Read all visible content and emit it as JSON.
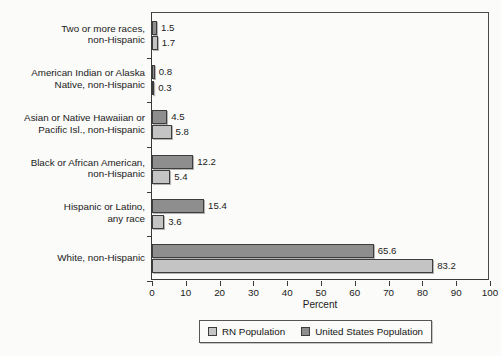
{
  "chart_data": {
    "type": "bar",
    "orientation": "horizontal",
    "grouped": true,
    "title": "",
    "xlabel": "Percent",
    "ylabel": "",
    "xlim": [
      0,
      100
    ],
    "xticks": [
      0,
      10,
      20,
      30,
      40,
      50,
      60,
      70,
      80,
      90,
      100
    ],
    "grid": false,
    "legend_position": "bottom",
    "categories": [
      "Two or more races, non-Hispanic",
      "American Indian or Alaska Native, non-Hispanic",
      "Asian or Native Hawaiian or Pacific Isl., non-Hispanic",
      "Black or African American, non-Hispanic",
      "Hispanic or Latino, any race",
      "White, non-Hispanic"
    ],
    "category_label_lines": [
      [
        "Two or more races,",
        "non-Hispanic"
      ],
      [
        "American Indian or Alaska",
        "Native, non-Hispanic"
      ],
      [
        "Asian or Native Hawaiian or",
        "Pacific Isl., non-Hispanic"
      ],
      [
        "Black or African American,",
        "non-Hispanic"
      ],
      [
        "Hispanic or Latino,",
        "any race"
      ],
      [
        "White, non-Hispanic"
      ]
    ],
    "series": [
      {
        "name": "United States Population",
        "color": "#8e8e8e",
        "values": [
          1.5,
          0.8,
          4.5,
          12.2,
          15.4,
          65.6
        ],
        "value_labels": [
          "1.5",
          "0.8",
          "4.5",
          "12.2",
          "15.4",
          "65.6"
        ]
      },
      {
        "name": "RN Population",
        "color": "#c4c4c4",
        "values": [
          1.7,
          0.3,
          5.8,
          5.4,
          3.6,
          83.2
        ],
        "value_labels": [
          "1.7",
          "0.3",
          "5.8",
          "5.4",
          "3.6",
          "83.2"
        ]
      }
    ]
  },
  "legend": {
    "items": [
      {
        "label": "RN Population",
        "swatch": "rn"
      },
      {
        "label": "United States Population",
        "swatch": "us"
      }
    ]
  },
  "axis": {
    "x_title": "Percent",
    "tick_labels": [
      "0",
      "10",
      "20",
      "30",
      "40",
      "50",
      "60",
      "70",
      "80",
      "90",
      "100"
    ]
  },
  "colors": {
    "rn_population": "#c4c4c4",
    "united_states_population": "#8e8e8e",
    "axis": "#3a3a3a",
    "text": "#1a1a1a",
    "background": "#fbfbf9"
  }
}
